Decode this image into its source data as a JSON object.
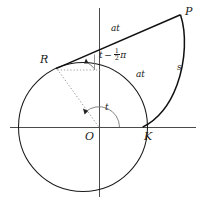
{
  "figure": {
    "colors": {
      "stroke": "#1a1a1a",
      "axis": "#3a3a3a",
      "dotted": "#8a8a8a",
      "background": "#ffffff"
    },
    "geometry": {
      "circle": {
        "cx": 83,
        "cy": 127,
        "r": 64.5
      },
      "origin": {
        "x": 99,
        "y": 127
      },
      "point_R": {
        "x": 57,
        "y": 68
      },
      "point_P": {
        "x": 180,
        "y": 15
      },
      "point_K": {
        "x": 142.5,
        "y": 127
      },
      "axis_x": {
        "x1": 10,
        "y1": 127,
        "x2": 196,
        "y2": 127
      },
      "axis_y": {
        "x1": 99,
        "y1": 8,
        "x2": 99,
        "y2": 197
      }
    }
  },
  "labels": {
    "point_P": "P",
    "point_R": "R",
    "point_O": "O",
    "point_K": "K",
    "tangent_length": "at",
    "arc_length": "at",
    "involute_arc": "s",
    "center_angle": "t",
    "tangent_angle_t": "t",
    "tangent_angle_minus": "−",
    "tangent_angle_num": "1",
    "tangent_angle_den": "2",
    "tangent_angle_pi": "π"
  },
  "icons": {
    "arrowhead": "arrow-head-icon"
  }
}
